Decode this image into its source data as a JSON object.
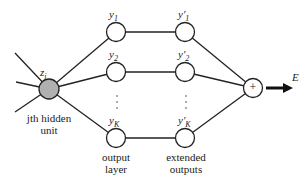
{
  "diagram": {
    "hidden_unit": {
      "label": "z",
      "sub": "j",
      "caption_line1": "jth hidden",
      "caption_line2": "unit",
      "fill": "#b0b0b0"
    },
    "output_layer": {
      "nodes": [
        {
          "label": "y",
          "sub": "1"
        },
        {
          "label": "y",
          "sub": "2"
        },
        {
          "label": "y",
          "sub": "K"
        }
      ],
      "caption_line1": "output",
      "caption_line2": "layer"
    },
    "extended_outputs": {
      "nodes": [
        {
          "label": "y′",
          "sub": "1"
        },
        {
          "label": "y′",
          "sub": "2"
        },
        {
          "label": "y′",
          "sub": "K"
        }
      ],
      "caption_line1": "extended",
      "caption_line2": "outputs"
    },
    "sum_node": {
      "symbol": "+"
    },
    "output": {
      "label": "E"
    },
    "ellipsis": "⋮"
  }
}
